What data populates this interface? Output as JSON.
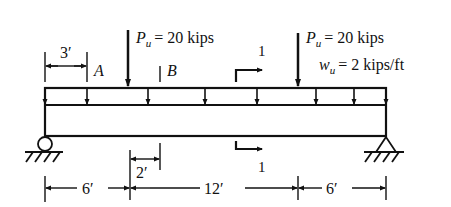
{
  "diagram": {
    "type": "simply-supported-beam",
    "loads": {
      "point_load_1": {
        "symbol": "P",
        "subscript": "u",
        "value_text": "= 20 kips"
      },
      "point_load_2": {
        "symbol": "P",
        "subscript": "u",
        "value_text": "= 20 kips"
      },
      "distributed_load": {
        "symbol": "w",
        "subscript": "u",
        "value_text": "= 2 kips/ft"
      }
    },
    "points": {
      "a": "A",
      "b": "B"
    },
    "section_cut": {
      "top_label": "1",
      "bottom_label": "1"
    },
    "dimensions": {
      "top_left": "3′",
      "small": "2′",
      "span_left": "6′",
      "span_middle": "12′",
      "span_right": "6′"
    },
    "colors": {
      "ink": "#111111",
      "background": "#ffffff"
    }
  }
}
